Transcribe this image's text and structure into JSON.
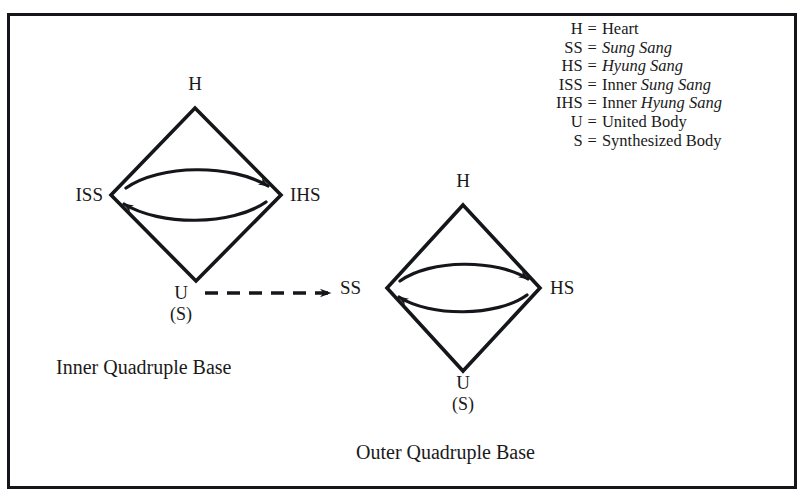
{
  "figure": {
    "type": "diagram",
    "background_color": "#ffffff",
    "ink_color": "#15161a",
    "border": {
      "color": "#15161a",
      "width_px": 3
    }
  },
  "legend": {
    "name": "abbreviation-key",
    "equals_sign": "=",
    "entries": [
      {
        "abbr": "H",
        "definition": "Heart",
        "italic_part": "",
        "plain_prefix": "Heart"
      },
      {
        "abbr": "SS",
        "definition": "Sung Sang",
        "italic_part": "Sung Sang",
        "plain_prefix": ""
      },
      {
        "abbr": "HS",
        "definition": "Hyung Sang",
        "italic_part": "Hyung Sang",
        "plain_prefix": ""
      },
      {
        "abbr": "ISS",
        "definition": "Inner Sung Sang",
        "italic_part": "Sung Sang",
        "plain_prefix": "Inner "
      },
      {
        "abbr": "IHS",
        "definition": "Inner Hyung Sang",
        "italic_part": "Hyung Sang",
        "plain_prefix": "Inner "
      },
      {
        "abbr": "U",
        "definition": "United Body",
        "italic_part": "",
        "plain_prefix": "United Body"
      },
      {
        "abbr": "S",
        "definition": "Synthesized Body",
        "italic_part": "",
        "plain_prefix": "Synthesized Body"
      }
    ]
  },
  "inner_base": {
    "caption": "Inner Quadruple Base",
    "nodes": {
      "top": "H",
      "left": "ISS",
      "right": "IHS",
      "bottom": "U",
      "bottom_sub": "(S)"
    },
    "arrows": {
      "forward": "ISS to IHS",
      "reverse": "IHS to ISS"
    }
  },
  "outer_base": {
    "caption": "Outer Quadruple Base",
    "nodes": {
      "top": "H",
      "left": "SS",
      "right": "HS",
      "bottom": "U",
      "bottom_sub": "(S)"
    },
    "arrows": {
      "forward": "SS to HS",
      "reverse": "HS to SS"
    }
  },
  "connector": {
    "name": "dashed-arrow",
    "from": "U",
    "to": "SS",
    "style": "dashed"
  }
}
